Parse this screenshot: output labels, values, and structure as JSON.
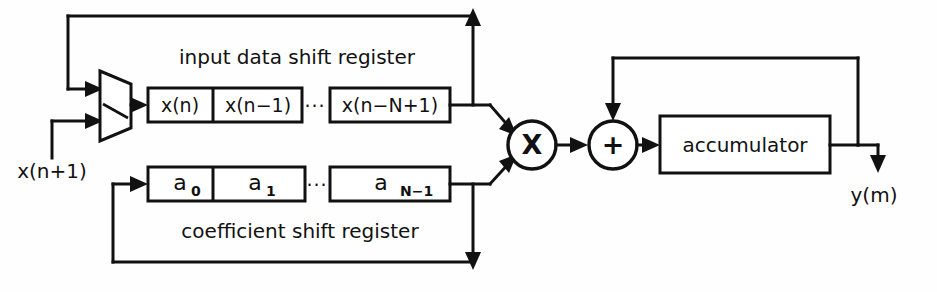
{
  "diagram": {
    "colors": {
      "ink": "#111111",
      "paper": "#ffffff"
    },
    "labels": {
      "input_register_caption": "input data shift register",
      "coefficient_register_caption": "coefficient shift register",
      "accumulator": "accumulator",
      "input_signal": "x(n+1)",
      "output_signal": "y(m)",
      "multiplier_symbol": "X",
      "adder_symbol": "+",
      "ellipsis": "···"
    },
    "input_register": {
      "name": "input data shift register",
      "cells": [
        {
          "text": "x(n)"
        },
        {
          "text": "x(n−1)"
        },
        {
          "text": "x(n−N+1)"
        }
      ]
    },
    "coefficient_register": {
      "name": "coefficient shift register",
      "cells": [
        {
          "base": "a",
          "sub": "0"
        },
        {
          "base": "a",
          "sub": "1"
        },
        {
          "base": "a",
          "sub": "N−1"
        }
      ]
    },
    "blocks": [
      {
        "name": "multiplexer",
        "label": ""
      },
      {
        "name": "multiplier",
        "label": "X"
      },
      {
        "name": "adder",
        "label": "+"
      },
      {
        "name": "accumulator",
        "label": "accumulator"
      }
    ],
    "signals": {
      "input": "x(n+1)",
      "output": "y(m)"
    }
  }
}
